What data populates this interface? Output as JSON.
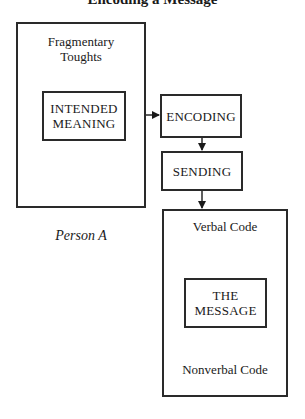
{
  "header": {
    "cut_title": "Encoding a Message"
  },
  "person_a": {
    "fragmentary_thoughts": [
      "Fragmentary",
      "Toughts"
    ],
    "intended_meaning": [
      "INTENDED",
      "MEANING"
    ],
    "caption": "Person A"
  },
  "process": {
    "encoding": "ENCODING",
    "sending": "SENDING"
  },
  "message_box": {
    "verbal": "Verbal Code",
    "message": [
      "THE",
      "MESSAGE"
    ],
    "nonverbal": "Nonverbal Code"
  },
  "colors": {
    "line": "#2a2a2a",
    "background": "#ffffff",
    "text": "#1a1a1a"
  }
}
